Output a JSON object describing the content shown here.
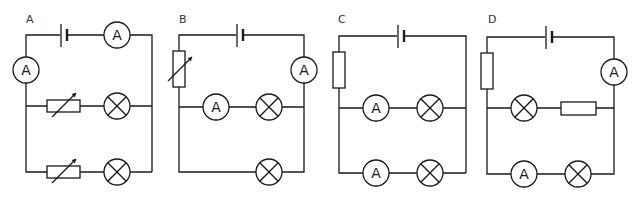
{
  "diagram": {
    "type": "circuit-options",
    "stroke_color": "#1a1a1a",
    "top_cut_text": "",
    "circuits": [
      {
        "label": "A",
        "components": [
          "cell",
          "ammeter (top, series)",
          "ammeter (left, series)",
          "branch1: variable resistor + lamp",
          "branch2: variable resistor + lamp"
        ]
      },
      {
        "label": "B",
        "components": [
          "cell",
          "variable resistor (left, series)",
          "ammeter (right, series)",
          "branch1: ammeter + lamp",
          "branch2: lamp"
        ]
      },
      {
        "label": "C",
        "components": [
          "cell",
          "fixed resistor (left, series)",
          "branch1: ammeter + lamp",
          "branch2: ammeter + lamp"
        ]
      },
      {
        "label": "D",
        "components": [
          "cell",
          "fixed resistor (left, series)",
          "ammeter (right, series)",
          "branch1: lamp + fixed resistor",
          "branch2: ammeter + lamp"
        ]
      }
    ],
    "ammeter_symbol": "A"
  }
}
